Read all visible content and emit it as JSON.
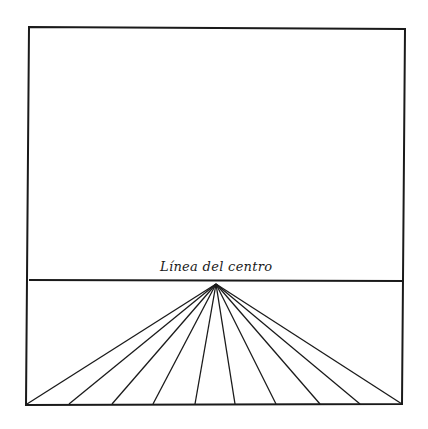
{
  "diagram": {
    "title_label": "Línea del centro",
    "ink_color": "#1a1a1a",
    "background": "#ffffff",
    "frame": {
      "top_left": [
        29,
        27
      ],
      "top_right": [
        405,
        29
      ],
      "bottom_right": [
        402,
        404
      ],
      "bottom_left": [
        26,
        405
      ]
    },
    "horizon_line": {
      "y_left": 280,
      "y_right": 281
    },
    "vanishing_point": [
      216,
      284
    ],
    "rays_bottom_x": [
      27,
      69,
      112,
      153,
      195,
      235,
      276,
      320,
      360,
      402
    ],
    "rays_bottom_y": 404
  }
}
